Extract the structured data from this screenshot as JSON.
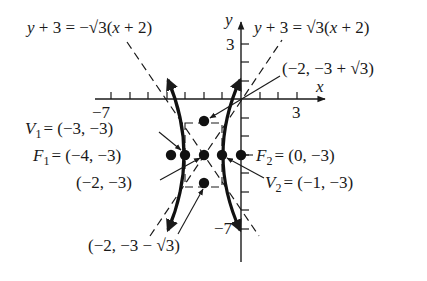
{
  "figure": {
    "type": "hyperbola-graph",
    "axes": {
      "x_label": "x",
      "y_label": "y",
      "tick_labels": {
        "x_neg": "−7",
        "x_pos": "3",
        "y_pos": "3",
        "y_neg": "−7"
      },
      "x_range": [
        -7,
        3
      ],
      "y_range": [
        -7,
        3
      ]
    },
    "asymptotes": [
      {
        "equation": "y + 3 = −√3(x + 2)",
        "slope": "-sqrt(3)",
        "style": "dashed"
      },
      {
        "equation": "y + 3 = √3(x + 2)",
        "slope": "sqrt(3)",
        "style": "dashed"
      }
    ],
    "center": {
      "label": "(−2, −3)",
      "x": -2,
      "y": -3
    },
    "vertices": [
      {
        "label": "V₁ = (−3, −3)",
        "name": "V",
        "sub": "1",
        "coords": "= (−3, −3)",
        "x": -3,
        "y": -3
      },
      {
        "label": "V₂ = (−1, −3)",
        "name": "V",
        "sub": "2",
        "coords": "= (−1, −3)",
        "x": -1,
        "y": -3
      }
    ],
    "foci": [
      {
        "label": "F₁ = (−4, −3)",
        "name": "F",
        "sub": "1",
        "coords": "= (−4, −3)",
        "x": -4,
        "y": -3
      },
      {
        "label": "F₂ = (0, −3)",
        "name": "F",
        "sub": "2",
        "coords": "= (0, −3)",
        "x": 0,
        "y": -3
      }
    ],
    "box_points": [
      {
        "label": "(−2, −3 + √3)",
        "x": -2,
        "y": -1.268
      },
      {
        "label": "(−2, −3 − √3)",
        "x": -2,
        "y": -4.732
      }
    ],
    "curve": {
      "description": "Hyperbola opening horizontally, center (−2,−3), a=1, b=√3, c=2",
      "style": "bold"
    }
  }
}
